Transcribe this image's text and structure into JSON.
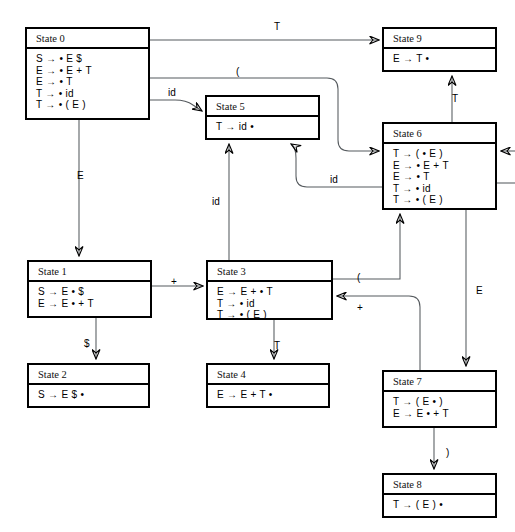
{
  "figure": {
    "title_fragment": "",
    "type": "lr-automaton-state-diagram"
  },
  "grammar_symbols": {
    "arrow": "→",
    "dot": "•"
  },
  "states": [
    {
      "id": "state-0",
      "title": "State 0",
      "items": [
        "S → • E $",
        "E → • E + T",
        "E → • T",
        "T → • id",
        "T → • ( E )"
      ],
      "x": 25,
      "y": 27,
      "w": 125,
      "h": 93
    },
    {
      "id": "state-9",
      "title": "State 9",
      "items": [
        "E → T •"
      ],
      "x": 382,
      "y": 27,
      "w": 115,
      "h": 45
    },
    {
      "id": "state-5",
      "title": "State 5",
      "items": [
        "T → id •"
      ],
      "x": 205,
      "y": 95,
      "w": 115,
      "h": 45
    },
    {
      "id": "state-6",
      "title": "State 6",
      "items": [
        "T → ( • E )",
        "E → • E + T",
        "E → • T",
        "T → • id",
        "T → • ( E )"
      ],
      "x": 382,
      "y": 122,
      "w": 115,
      "h": 88
    },
    {
      "id": "state-1",
      "title": "State 1",
      "items": [
        "S → E • $",
        "E → E • + T"
      ],
      "x": 27,
      "y": 260,
      "w": 125,
      "h": 58
    },
    {
      "id": "state-3",
      "title": "State 3",
      "items": [
        "E → E + • T",
        "T → • id",
        "T → • ( E )"
      ],
      "x": 206,
      "y": 260,
      "w": 127,
      "h": 60
    },
    {
      "id": "state-2",
      "title": "State 2",
      "items": [
        "S → E $ •"
      ],
      "x": 27,
      "y": 363,
      "w": 123,
      "h": 45
    },
    {
      "id": "state-4",
      "title": "State 4",
      "items": [
        "E → E + T •"
      ],
      "x": 206,
      "y": 363,
      "w": 124,
      "h": 45
    },
    {
      "id": "state-7",
      "title": "State 7",
      "items": [
        "T → ( E • )",
        "E → E • + T"
      ],
      "x": 382,
      "y": 370,
      "w": 115,
      "h": 58
    },
    {
      "id": "state-8",
      "title": "State 8",
      "items": [
        "T → ( E ) •"
      ],
      "x": 382,
      "y": 473,
      "w": 115,
      "h": 45
    }
  ],
  "transitions": [
    {
      "id": "t0-9",
      "label": "T",
      "from": "state-0",
      "to": "state-9",
      "lx": 274,
      "ly": 21
    },
    {
      "id": "t0-6",
      "label": "(",
      "from": "state-0",
      "to": "state-6",
      "lx": 236,
      "ly": 66
    },
    {
      "id": "t0-5",
      "label": "id",
      "from": "state-0",
      "to": "state-5",
      "lx": 168,
      "ly": 87
    },
    {
      "id": "t0-1",
      "label": "E",
      "from": "state-0",
      "to": "state-1",
      "lx": 77,
      "ly": 170
    },
    {
      "id": "t1-3",
      "label": "+",
      "from": "state-1",
      "to": "state-3",
      "lx": 171,
      "ly": 276
    },
    {
      "id": "t1-2",
      "label": "$",
      "from": "state-1",
      "to": "state-2",
      "lx": 84,
      "ly": 338
    },
    {
      "id": "t3-4",
      "label": "T",
      "from": "state-3",
      "to": "state-4",
      "lx": 274,
      "ly": 340
    },
    {
      "id": "t3-5",
      "label": "id",
      "from": "state-3",
      "to": "state-5",
      "lx": 212,
      "ly": 196
    },
    {
      "id": "t3-6",
      "label": "(",
      "from": "state-3",
      "to": "state-6",
      "lx": 357,
      "ly": 272
    },
    {
      "id": "t6-9",
      "label": "T",
      "from": "state-6",
      "to": "state-9",
      "lx": 452,
      "ly": 93
    },
    {
      "id": "t6-5",
      "label": "id",
      "from": "state-6",
      "to": "state-5",
      "lx": 330,
      "ly": 174
    },
    {
      "id": "t6-7",
      "label": "E",
      "from": "state-6",
      "to": "state-7",
      "lx": 476,
      "ly": 285
    },
    {
      "id": "t7-3",
      "label": "+",
      "from": "state-7",
      "to": "state-3",
      "lx": 357,
      "ly": 302
    },
    {
      "id": "t7-8",
      "label": ")",
      "from": "state-7",
      "to": "state-8",
      "lx": 446,
      "ly": 447
    }
  ]
}
